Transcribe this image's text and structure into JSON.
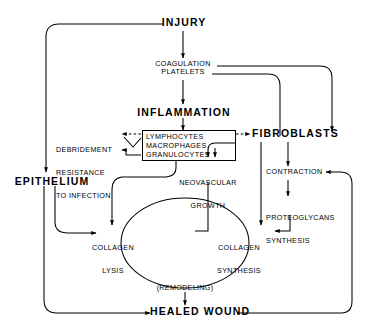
{
  "diagram": {
    "ink_color": "#000000",
    "background": "#ffffff",
    "nodes": {
      "injury": "INJURY",
      "coagulation": "COAGULATION",
      "platelets": "PLATELETS",
      "inflammation": "INFLAMMATION",
      "debridement_l1": "DEBRIDEMENT",
      "debridement_l2": "RESISTANCE",
      "debridement_l3": "TO INFECTION",
      "cells_l1": "LYMPHOCYTES",
      "cells_l2": "MACROPHAGES",
      "cells_l3": "GRANULOCYTES",
      "fibroblasts": "FIBROBLASTS",
      "neovascular_l1": "NEOVASCULAR",
      "neovascular_l2": "GROWTH",
      "contraction": "CONTRACTION",
      "proteoglycans_l1": "PROTEOGLYCANS",
      "proteoglycans_l2": "SYNTHESIS",
      "epithelium": "EPITHELIUM",
      "collagen_lysis_l1": "COLLAGEN",
      "collagen_lysis_l2": "LYSIS",
      "collagen_synthesis_l1": "COLLAGEN",
      "collagen_synthesis_l2": "SYNTHESIS",
      "remodeling": "(REMODELING)",
      "healed_wound": "HEALED WOUND"
    }
  }
}
